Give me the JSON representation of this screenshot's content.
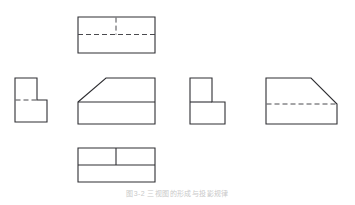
{
  "document": {
    "kind": "engineering-orthographic-projection-plate",
    "background_color": "#ffffff",
    "page_width": 355,
    "page_height": 205,
    "caption": "图3-2  三视图的形成与投影规律"
  },
  "style": {
    "visible_line_color": "#2f2f33",
    "visible_line_width": 1.1,
    "hidden_line_color": "#4a4a4e",
    "hidden_line_width": 1.0,
    "hidden_dash_pattern": "5,3"
  },
  "views": [
    {
      "id": "top-view",
      "label": "top view",
      "position": "upper-center",
      "outline": {
        "x": 78,
        "y": 17,
        "width": 77,
        "height": 36
      },
      "hidden_lines": [
        {
          "type": "horizontal",
          "x1": 78,
          "y1": 34.5,
          "x2": 155,
          "y2": 34.5
        },
        {
          "type": "vertical",
          "x1": 116,
          "y1": 17,
          "x2": 116,
          "y2": 34.5
        }
      ],
      "visible_lines": []
    },
    {
      "id": "left-side-view",
      "label": "left side view",
      "position": "middle-left",
      "outline_points": "15,78 37,78 37,100 47,100 47,122 15,122",
      "hidden_lines": [
        {
          "type": "horizontal",
          "x1": 15,
          "y1": 100,
          "x2": 37,
          "y2": 100
        }
      ]
    },
    {
      "id": "front-view",
      "label": "front view",
      "position": "middle-center",
      "outline_points": "78,102 106,78 155,78 155,124 78,124",
      "visible_lines": [
        {
          "type": "horizontal",
          "x1": 78,
          "y1": 102,
          "x2": 155,
          "y2": 102
        }
      ],
      "hidden_lines": []
    },
    {
      "id": "right-side-view",
      "label": "right side view",
      "position": "middle-right-inner",
      "outline_points": "190,78 212,78 212,102 225,102 225,124 190,124",
      "visible_lines": [
        {
          "type": "horizontal",
          "x1": 190,
          "y1": 102,
          "x2": 212,
          "y2": 102
        }
      ],
      "hidden_lines": []
    },
    {
      "id": "pictorial-view",
      "label": "pictorial view",
      "position": "middle-far-right",
      "outline_points": "266,78 311,78 337,104 337,124 266,124",
      "hidden_lines": [
        {
          "type": "horizontal",
          "x1": 266,
          "y1": 104,
          "x2": 337,
          "y2": 104
        }
      ],
      "visible_lines": []
    },
    {
      "id": "bottom-view",
      "label": "bottom view",
      "position": "lower-center",
      "outline": {
        "x": 78,
        "y": 148,
        "width": 77,
        "height": 34
      },
      "visible_lines": [
        {
          "type": "horizontal",
          "x1": 78,
          "y1": 165,
          "x2": 155,
          "y2": 165
        },
        {
          "type": "vertical",
          "x1": 116,
          "y1": 148,
          "x2": 116,
          "y2": 165
        }
      ],
      "hidden_lines": []
    }
  ]
}
